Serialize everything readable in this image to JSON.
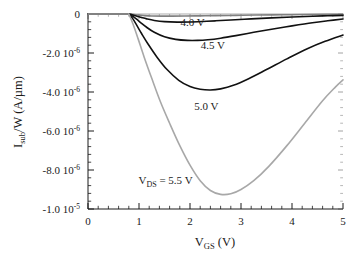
{
  "figure": {
    "background_color": "#ffffff",
    "foreground_color": "#1a1a1a"
  },
  "chart_data": {
    "type": "line",
    "title": "",
    "subtitle": "",
    "xlabel": "V_GS  (V)",
    "xlabel_main": "V",
    "xlabel_sub": "GS",
    "xlabel_unit": "(V)",
    "ylabel": "I_sub/W  (A/µm)",
    "ylabel_main": "I",
    "ylabel_sub": "sub",
    "ylabel_rest": "/W   (A/µm)",
    "xlim": [
      0,
      5
    ],
    "ylim": [
      -1e-05,
      0
    ],
    "grid": false,
    "legend_position": "inline-annotations",
    "xticks": [
      0,
      1,
      2,
      3,
      4,
      5
    ],
    "xtick_labels": [
      "0",
      "1",
      "2",
      "3",
      "4",
      "5"
    ],
    "x_minor_per_major": 5,
    "yticks": [
      0,
      -2e-06,
      -4e-06,
      -6e-06,
      -8e-06,
      -1e-05
    ],
    "ytick_labels": [
      {
        "mantissa": "0",
        "exponent": ""
      },
      {
        "mantissa": "-2.0 10",
        "exponent": "-6"
      },
      {
        "mantissa": "-4.0 10",
        "exponent": "-6"
      },
      {
        "mantissa": "-6.0 10",
        "exponent": "-6"
      },
      {
        "mantissa": "-8.0 10",
        "exponent": "-6"
      },
      {
        "mantissa": "-1.0 10",
        "exponent": "-5"
      }
    ],
    "y_minor_per_major": 5,
    "annotations": [
      {
        "text": "4.0 V",
        "x": 2.05,
        "y": -6.2e-07,
        "name": "curve-label-4-0v"
      },
      {
        "text": "4.5 V",
        "x": 2.45,
        "y": -1.78e-06,
        "name": "curve-label-4-5v"
      },
      {
        "text": "5.0 V",
        "x": 2.32,
        "y": -4.92e-06,
        "name": "curve-label-5-0v"
      }
    ],
    "annotation_vds": {
      "prefix": "V",
      "sub": "DS",
      "suffix": " = 5.5 V",
      "x": 1.52,
      "y": -8.72e-06,
      "name": "curve-label-vds-5-5v"
    },
    "series": [
      {
        "name": "V_DS = 3.5 V",
        "label": "3.5 V",
        "color": "#808080",
        "width": 1.2,
        "x": [
          0.8,
          0.9,
          1.0,
          1.1,
          1.25,
          1.45,
          1.65,
          1.9,
          2.2,
          2.5,
          2.9,
          3.3,
          3.8,
          4.3,
          4.7,
          5.0
        ],
        "y": [
          0.0,
          -3e-08,
          -6e-08,
          -8e-08,
          -1e-07,
          -1.1e-07,
          -1.1e-07,
          -1.05e-07,
          -9.5e-08,
          -8.5e-08,
          -7e-08,
          -5.5e-08,
          -4e-08,
          -2.8e-08,
          -2e-08,
          -1.6e-08
        ]
      },
      {
        "name": "V_DS = 4.0 V",
        "label": "4.0 V",
        "color": "#111111",
        "width": 1.6,
        "x": [
          0.8,
          0.88,
          0.96,
          1.05,
          1.15,
          1.3,
          1.5,
          1.75,
          2.0,
          2.25,
          2.5,
          2.8,
          3.2,
          3.6,
          4.0,
          4.4,
          4.7,
          5.0
        ],
        "y": [
          0.0,
          -5e-08,
          -1.1e-07,
          -1.8e-07,
          -2.5e-07,
          -3.3e-07,
          -3.9e-07,
          -4.15e-07,
          -4.1e-07,
          -3.85e-07,
          -3.5e-07,
          -3.05e-07,
          -2.5e-07,
          -2e-07,
          -1.55e-07,
          -1.15e-07,
          -9e-08,
          -7e-08
        ]
      },
      {
        "name": "V_DS = 4.5 V",
        "label": "4.5 V",
        "color": "#111111",
        "width": 1.7,
        "x": [
          0.8,
          0.88,
          0.96,
          1.05,
          1.15,
          1.3,
          1.5,
          1.72,
          1.95,
          2.15,
          2.35,
          2.6,
          2.9,
          3.25,
          3.6,
          4.0,
          4.4,
          4.7,
          5.0
        ],
        "y": [
          0.0,
          -1.2e-07,
          -2.8e-07,
          -4.8e-07,
          -6.8e-07,
          -9.4e-07,
          -1.17e-06,
          -1.3e-06,
          -1.355e-06,
          -1.355e-06,
          -1.32e-06,
          -1.24e-06,
          -1.11e-06,
          -9.4e-07,
          -7.8e-07,
          -6.1e-07,
          -4.5e-07,
          -3.5e-07,
          -2.6e-07
        ]
      },
      {
        "name": "V_DS = 5.0 V",
        "label": "5.0 V",
        "color": "#111111",
        "width": 1.8,
        "x": [
          0.8,
          0.88,
          0.96,
          1.05,
          1.18,
          1.35,
          1.55,
          1.78,
          2.0,
          2.2,
          2.4,
          2.6,
          2.85,
          3.15,
          3.5,
          3.9,
          4.3,
          4.65,
          5.0
        ],
        "y": [
          0.0,
          -2.5e-07,
          -6e-07,
          -1e-06,
          -1.55e-06,
          -2.2e-06,
          -2.85e-06,
          -3.4e-06,
          -3.72e-06,
          -3.86e-06,
          -3.9e-06,
          -3.84e-06,
          -3.66e-06,
          -3.32e-06,
          -2.85e-06,
          -2.3e-06,
          -1.78e-06,
          -1.4e-06,
          -1.08e-06
        ]
      },
      {
        "name": "V_DS = 5.5 V",
        "label": "5.5 V",
        "color": "#a8a8a8",
        "width": 1.7,
        "x": [
          0.8,
          0.88,
          0.98,
          1.1,
          1.25,
          1.42,
          1.6,
          1.8,
          2.0,
          2.2,
          2.4,
          2.6,
          2.8,
          3.0,
          3.25,
          3.55,
          3.9,
          4.25,
          4.6,
          4.85,
          5.0
        ],
        "y": [
          0.0,
          -5e-07,
          -1.25e-06,
          -2.2e-06,
          -3.3e-06,
          -4.5e-06,
          -5.6e-06,
          -6.75e-06,
          -7.75e-06,
          -8.55e-06,
          -9.05e-06,
          -9.25e-06,
          -9.22e-06,
          -9e-06,
          -8.55e-06,
          -7.8e-06,
          -6.75e-06,
          -5.6e-06,
          -4.45e-06,
          -3.75e-06,
          -3.38e-06
        ]
      }
    ]
  }
}
